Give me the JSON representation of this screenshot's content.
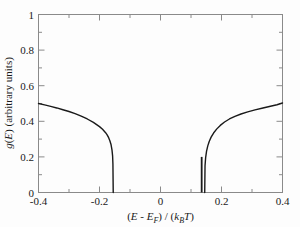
{
  "figure": {
    "background_color": "#fdfdfd",
    "axis_color": "#8a8a8a",
    "curve_color": "#1a1a1a",
    "tick_color": "#8a8a8a"
  },
  "axes": {
    "x": {
      "title_parts": {
        "open1": "(",
        "var1": "E",
        "minus": " - ",
        "var2": "E",
        "sub2": "F",
        "close1": ")",
        "slash": " / ",
        "open2": "(",
        "var3": "k",
        "sub3": "B",
        "var4": "T",
        "close2": ")"
      },
      "title_plain": "(E - EF) / (kB T)",
      "tick_labels": [
        "-0.4",
        "-0.2",
        "0",
        "0.2",
        "0.4"
      ],
      "tick_values": [
        -0.4,
        -0.2,
        0,
        0.2,
        0.4
      ],
      "minor_tick_values": [
        -0.3,
        -0.1,
        0.1,
        0.3
      ],
      "range": [
        -0.4,
        0.4
      ]
    },
    "y": {
      "title_parts": {
        "var1": "g",
        "open1": "(",
        "var2": "E",
        "close1": ")",
        "units": "  (arbitrary units)"
      },
      "title_plain": "g(E)  (arbitrary units)",
      "tick_labels": [
        "0",
        "0.2",
        "0.4",
        "0.6",
        "0.8",
        "1"
      ],
      "tick_values": [
        0,
        0.2,
        0.4,
        0.6,
        0.8,
        1
      ],
      "minor_tick_values": [
        0.1,
        0.3,
        0.5,
        0.7,
        0.9
      ],
      "range": [
        0,
        1
      ]
    }
  },
  "chart_data": {
    "type": "line",
    "title": "",
    "xlabel": "(E - E_F) / (k_B T)",
    "ylabel": "g(E)  (arbitrary units)",
    "xlim": [
      -0.4,
      0.4
    ],
    "ylim": [
      0,
      1
    ],
    "grid": false,
    "legend": false,
    "gap": {
      "left_edge": -0.155,
      "right_edge": 0.145
    },
    "series": [
      {
        "name": "left-branch",
        "x": [
          -0.4,
          -0.38,
          -0.36,
          -0.34,
          -0.32,
          -0.3,
          -0.28,
          -0.26,
          -0.24,
          -0.22,
          -0.2,
          -0.19,
          -0.18,
          -0.175,
          -0.17,
          -0.166,
          -0.162,
          -0.159,
          -0.157,
          -0.156,
          -0.155
        ],
        "y": [
          0.5,
          0.492,
          0.484,
          0.475,
          0.465,
          0.455,
          0.443,
          0.429,
          0.413,
          0.394,
          0.37,
          0.355,
          0.336,
          0.324,
          0.308,
          0.291,
          0.268,
          0.238,
          0.204,
          0.16,
          0.0
        ]
      },
      {
        "name": "right-branch",
        "x": [
          0.145,
          0.146,
          0.148,
          0.151,
          0.155,
          0.16,
          0.166,
          0.174,
          0.184,
          0.196,
          0.21,
          0.226,
          0.244,
          0.264,
          0.286,
          0.31,
          0.336,
          0.364,
          0.382,
          0.4
        ],
        "y": [
          0.0,
          0.15,
          0.196,
          0.232,
          0.262,
          0.288,
          0.311,
          0.334,
          0.356,
          0.377,
          0.396,
          0.413,
          0.428,
          0.441,
          0.453,
          0.464,
          0.475,
          0.486,
          0.493,
          0.503
        ]
      },
      {
        "name": "impurity-spike",
        "x": [
          0.135,
          0.135
        ],
        "y": [
          0.0,
          0.2
        ]
      }
    ]
  }
}
